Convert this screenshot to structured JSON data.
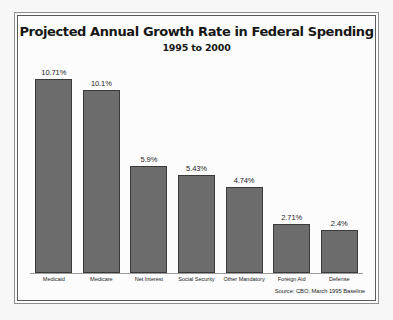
{
  "chart_data": {
    "type": "bar",
    "title": "Projected Annual Growth Rate in Federal Spending",
    "subtitle": "1995 to 2000",
    "xlabel": "",
    "ylabel": "",
    "ylim": [
      0,
      10.71
    ],
    "grid": false,
    "legend": "none",
    "source": "Source: CBO, March 1995 Baseline",
    "bar_color": "#6c6c6c",
    "bar_outline_color": "#3a3a3a",
    "categories": [
      "Medicaid",
      "Medicare",
      "Net Interest",
      "Social Security",
      "Other Mandatory",
      "Foreign Aid",
      "Defense"
    ],
    "values": [
      10.71,
      10.1,
      5.9,
      5.43,
      4.74,
      2.71,
      2.4
    ],
    "value_labels": [
      "10.71%",
      "10.1%",
      "5.9%",
      "5.43%",
      "4.74%",
      "2.71%",
      "2.4%"
    ]
  }
}
